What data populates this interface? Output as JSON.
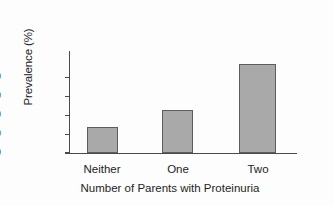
{
  "chart_data": {
    "type": "bar",
    "title": "",
    "subtitle": "",
    "categories": [
      "Neither",
      "One",
      "Two"
    ],
    "values": [
      14,
      23,
      47
    ],
    "xlabel": "Number of Parents with Proteinuria",
    "ylabel": "Prevalence (%)",
    "ylim": [
      0,
      54
    ],
    "yticks": [
      0,
      10,
      20,
      30,
      40
    ],
    "ytick_labels": [
      "0",
      "10",
      "20",
      "30",
      "40"
    ],
    "grid": false,
    "legend": false,
    "legend_position": "none",
    "annotations": [],
    "colors": {
      "bar_fill": "#a9a9a9",
      "bar_edge": "#5d5d5d",
      "axis": "#4a4a4a",
      "text": "#242424",
      "background": "#fdfdfd"
    }
  }
}
